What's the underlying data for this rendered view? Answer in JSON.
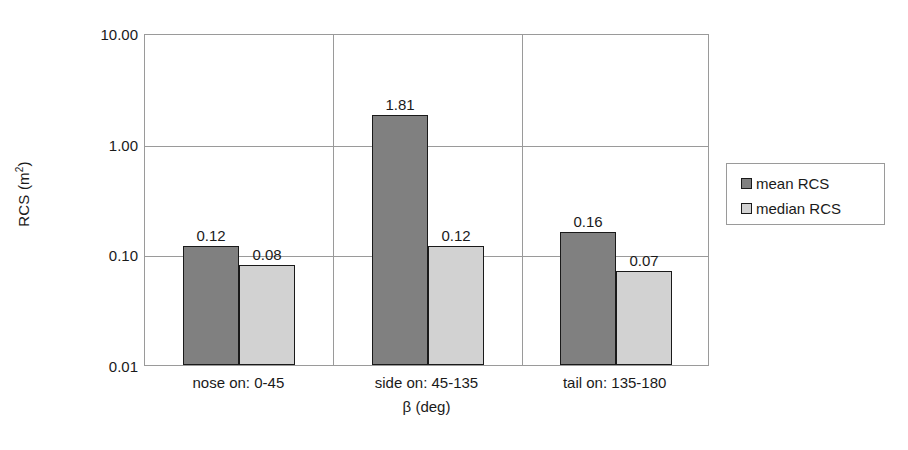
{
  "chart_data": {
    "type": "bar",
    "title": "",
    "subtitle": "",
    "xlabel": "β (deg)",
    "ylabel": "RCS (m²)",
    "ylabel_base": "RCS (m",
    "ylabel_sup": "2",
    "ylabel_tail": ")",
    "yscale": "log",
    "ylim": [
      0.01,
      10.0
    ],
    "grid": "horizontal-and-category-separators",
    "legend_position": "right",
    "categories": [
      "nose on:  0-45",
      "side on: 45-135",
      "tail on: 135-180"
    ],
    "ytick_labels": [
      "10.00",
      "1.00",
      "0.10",
      "0.01"
    ],
    "ytick_values": [
      10.0,
      1.0,
      0.1,
      0.01
    ],
    "series": [
      {
        "name": "mean RCS",
        "color": "#808080",
        "values": [
          0.12,
          1.81,
          0.16
        ],
        "labels": [
          "0.12",
          "1.81",
          "0.16"
        ]
      },
      {
        "name": "median RCS",
        "color": "#d2d2d2",
        "values": [
          0.08,
          0.12,
          0.07
        ],
        "labels": [
          "0.08",
          "0.12",
          "0.07"
        ]
      }
    ]
  },
  "axes": {
    "y_title": "RCS (m",
    "y_title_sup": "2",
    "y_title_end": ")",
    "x_title": "β (deg)",
    "y_ticks": [
      {
        "label": "10.00",
        "top": 27
      },
      {
        "label": "1.00",
        "top": 138
      },
      {
        "label": "0.10",
        "top": 248
      },
      {
        "label": "0.01",
        "top": 359
      }
    ],
    "x_categories": [
      {
        "label": "nose on:  0-45",
        "center_pct": 16.7
      },
      {
        "label": "side on: 45-135",
        "center_pct": 50.0
      },
      {
        "label": "tail on: 135-180",
        "center_pct": 83.3
      }
    ]
  },
  "legend": {
    "entries": [
      {
        "label": "mean RCS",
        "swatch": "mean"
      },
      {
        "label": "median RCS",
        "swatch": "median"
      }
    ]
  },
  "colors": {
    "mean": "#808080",
    "median": "#d2d2d2",
    "grid": "#9a9a9a",
    "outline": "#1a1a1a",
    "background": "#ffffff"
  }
}
